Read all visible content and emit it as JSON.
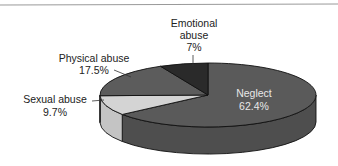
{
  "chart_data": {
    "type": "pie",
    "style": "3d",
    "title": "",
    "slices": [
      {
        "label": "Neglect",
        "value": 62.4,
        "display": "62.4%",
        "color": "#5a5a5a",
        "side_color": "#4e4e4e",
        "label_position": "inside"
      },
      {
        "label": "Sexual abuse",
        "value": 9.7,
        "display": "9.7%",
        "color": "#d4d4d4",
        "side_color": "#c4c4c4",
        "label_position": "outside-left"
      },
      {
        "label": "Physical abuse",
        "value": 17.5,
        "display": "17.5%",
        "color": "#5c5c5c",
        "side_color": "#505050",
        "label_position": "outside-left"
      },
      {
        "label": "Emotional abuse",
        "value": 7,
        "display": "7%",
        "color": "#2a2a2a",
        "side_color": "#222222",
        "label_position": "outside-top"
      }
    ],
    "legend": "none",
    "frame_top_rule": true
  },
  "labels": {
    "neglect": {
      "line1": "Neglect",
      "line2": "62.4%"
    },
    "sexual": {
      "line1": "Sexual abuse",
      "line2": "9.7%"
    },
    "physical": {
      "line1": "Physical abuse",
      "line2": "17.5%"
    },
    "emotional": {
      "line1": "Emotional",
      "line2": "abuse",
      "line3": "7%"
    }
  }
}
